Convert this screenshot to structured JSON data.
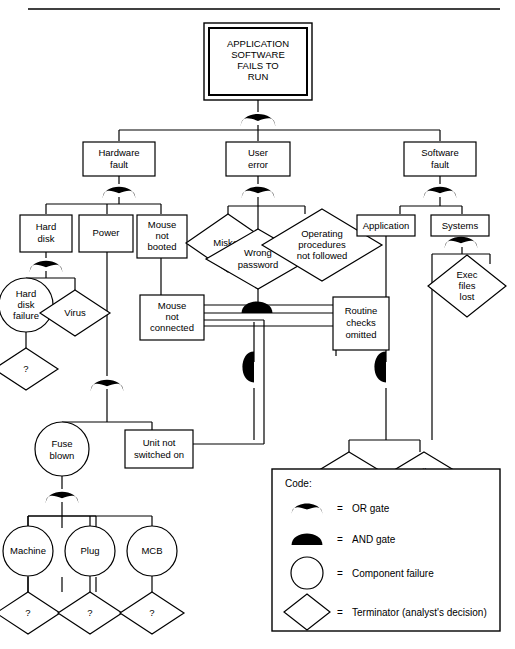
{
  "diagram": {
    "title_box": {
      "text": "APPLICATION SOFTWARE FAILS TO RUN",
      "lines": [
        "APPLICATION",
        "SOFTWARE",
        "FAILS TO",
        "RUN"
      ]
    },
    "nodes": {
      "hardware_fault": [
        "Hardware",
        "fault"
      ],
      "user_error": [
        "User",
        "error"
      ],
      "software_fault": [
        "Software",
        "fault"
      ],
      "hard_disk": [
        "Hard",
        "disk"
      ],
      "power": [
        "Power"
      ],
      "mouse_not_booted": [
        "Mouse",
        "not",
        "booted"
      ],
      "miskey": [
        "Miskey"
      ],
      "wrong_password": [
        "Wrong",
        "password"
      ],
      "operating_procedures": [
        "Operating",
        "procedures",
        "not followed"
      ],
      "application": [
        "Application"
      ],
      "systems": [
        "Systems"
      ],
      "hard_disk_failure": [
        "Hard",
        "disk",
        "failure"
      ],
      "virus": [
        "Virus"
      ],
      "exec_files_lost": [
        "Exec",
        "files",
        "lost"
      ],
      "mouse_not_connected": [
        "Mouse",
        "not",
        "connected"
      ],
      "routine_checks_omitted": [
        "Routine",
        "checks",
        "omitted"
      ],
      "not_resident": [
        "Not",
        "resident"
      ],
      "file_corrupt": [
        "File",
        "corrupt"
      ],
      "fuse_blown": [
        "Fuse",
        "blown"
      ],
      "unit_not_switched_on": [
        "Unit not",
        "switched on"
      ],
      "machine": [
        "Machine"
      ],
      "plug": [
        "Plug"
      ],
      "mcb": [
        "MCB"
      ],
      "terminator_q": [
        "?"
      ]
    },
    "legend": {
      "title": "Code:",
      "items": [
        {
          "symbol": "or-gate",
          "equals": "=",
          "label": "OR gate"
        },
        {
          "symbol": "and-gate",
          "equals": "=",
          "label": "AND gate"
        },
        {
          "symbol": "circle",
          "equals": "=",
          "label": "Component failure"
        },
        {
          "symbol": "diamond",
          "equals": "=",
          "label": "Terminator (analyst's decision)"
        }
      ]
    },
    "colors": {
      "stroke": "#000000",
      "fill": "#ffffff",
      "gate_fill": "#000000"
    }
  }
}
